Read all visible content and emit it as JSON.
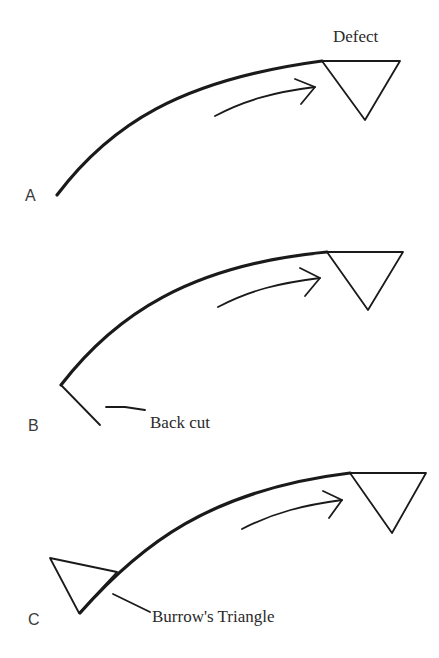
{
  "diagram": {
    "panels": [
      {
        "id": "A",
        "label": "A",
        "annotation": "Defect"
      },
      {
        "id": "B",
        "label": "B",
        "annotation": "Back cut"
      },
      {
        "id": "C",
        "label": "C",
        "annotation": "Burrow's Triangle"
      }
    ],
    "colors": {
      "line": "#1a1a1a",
      "text": "#2a2a2a",
      "background": "#ffffff"
    }
  }
}
